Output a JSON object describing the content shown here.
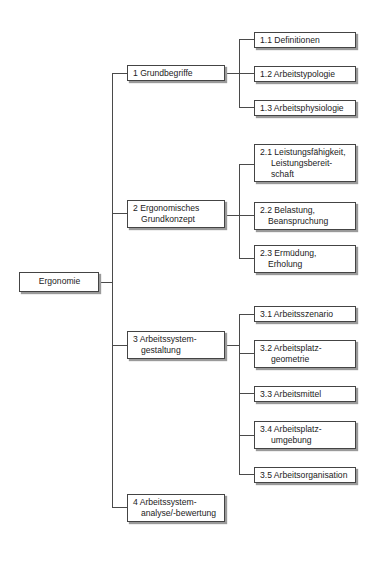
{
  "root": {
    "label": "Ergonomie"
  },
  "level1": [
    {
      "lines": [
        "1 Grundbegriffe"
      ]
    },
    {
      "lines": [
        "2 Ergonomisches",
        "Grundkonzept"
      ]
    },
    {
      "lines": [
        "3 Arbeitssystem-",
        "gestaltung"
      ]
    },
    {
      "lines": [
        "4 Arbeitssystem-",
        "analyse/-bewertung"
      ]
    }
  ],
  "level2": {
    "grundbegriffe": [
      {
        "lines": [
          "1.1  Definitionen"
        ]
      },
      {
        "lines": [
          "1.2  Arbeitstypologie"
        ]
      },
      {
        "lines": [
          "1.3  Arbeitsphysiologie"
        ]
      }
    ],
    "grundkonzept": [
      {
        "lines": [
          "2.1  Leistungsfähigkeit,",
          "Leistungsbereit-",
          "schaft"
        ]
      },
      {
        "lines": [
          "2.2 Belastung,",
          "Beanspruchung"
        ]
      },
      {
        "lines": [
          "2.3 Ermüdung,",
          "Erholung"
        ]
      }
    ],
    "gestaltung": [
      {
        "lines": [
          "3.1  Arbeitsszenario"
        ]
      },
      {
        "lines": [
          "3.2 Arbeitsplatz-",
          "geometrie"
        ]
      },
      {
        "lines": [
          "3.3 Arbeitsmittel"
        ]
      },
      {
        "lines": [
          "3.4 Arbeitsplatz-",
          "umgebung"
        ]
      },
      {
        "lines": [
          "3.5  Arbeitsorganisation"
        ]
      }
    ]
  },
  "colors": {
    "line": "#4a4a4a",
    "border": "#444444",
    "shadow": "#9a9a9a"
  }
}
